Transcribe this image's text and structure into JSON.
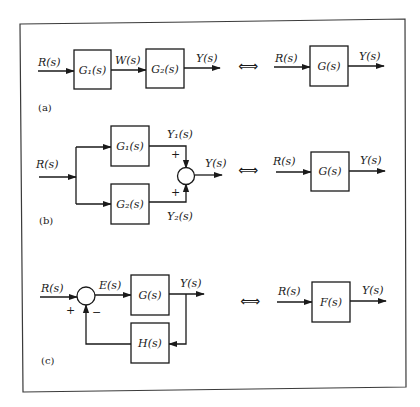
{
  "figure": {
    "frame_color": "#3a3a3a",
    "equivalence_symbol": "⟺",
    "panels": [
      {
        "tag": "(a)",
        "name": "series",
        "left": {
          "input": "R(s)",
          "blocks": [
            "G₁(s)",
            "G₂(s)"
          ],
          "intermediate": "W(s)",
          "output": "Y(s)"
        },
        "right": {
          "input": "R(s)",
          "block": "G(s)",
          "output": "Y(s)"
        }
      },
      {
        "tag": "(b)",
        "name": "parallel",
        "left": {
          "input": "R(s)",
          "blocks": [
            "G₁(s)",
            "G₂(s)"
          ],
          "branch_outputs": [
            "Y₁(s)",
            "Y₂(s)"
          ],
          "signs": [
            "+",
            "+"
          ],
          "output": "Y(s)"
        },
        "right": {
          "input": "R(s)",
          "block": "G(s)",
          "output": "Y(s)"
        }
      },
      {
        "tag": "(c)",
        "name": "feedback",
        "left": {
          "input": "R(s)",
          "error": "E(s)",
          "forward_block": "G(s)",
          "feedback_block": "H(s)",
          "signs": [
            "+",
            "−"
          ],
          "output": "Y(s)"
        },
        "right": {
          "input": "R(s)",
          "block": "F(s)",
          "output": "Y(s)"
        }
      }
    ]
  }
}
